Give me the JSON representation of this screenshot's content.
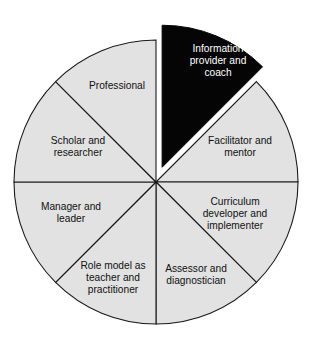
{
  "chart_data": {
    "type": "pie",
    "title": "",
    "subtitle": "",
    "xlabel": "",
    "ylabel": "",
    "legend_position": "none",
    "grid": false,
    "total_slices": 8,
    "slice_angle_degrees": 45,
    "start_angle_degrees": 0,
    "equal_slices": true,
    "categories": [
      "Information provider and coach",
      "Facilitator and mentor",
      "Curriculum developer and implementer",
      "Assessor and diagnostician",
      "Role model as teacher and practitioner",
      "Manager and leader",
      "Scholar and researcher",
      "Professional"
    ],
    "values": [
      12.5,
      12.5,
      12.5,
      12.5,
      12.5,
      12.5,
      12.5,
      12.5
    ],
    "colors": [
      "#050505",
      "#e2e2e2",
      "#e2e2e2",
      "#e2e2e2",
      "#e2e2e2",
      "#e2e2e2",
      "#e2e2e2",
      "#e2e2e2"
    ],
    "exploded": [
      true,
      false,
      false,
      false,
      false,
      false,
      false,
      false
    ],
    "annotations": []
  },
  "geometry": {
    "center_x": 156,
    "center_y": 182,
    "radius": 142,
    "explode_offset": 16,
    "stroke_color": "#1a1a1a",
    "background": "#ffffff"
  },
  "slices": [
    {
      "id": "information-provider-and-coach",
      "lines": [
        "Information",
        "provider and",
        "coach"
      ],
      "color": "#050505",
      "text_color": "#ffffff",
      "exploded": true,
      "start_deg": 0,
      "end_deg": 45,
      "label_x": 218,
      "label_y": 61
    },
    {
      "id": "facilitator-and-mentor",
      "lines": [
        "Facilitator and",
        "mentor"
      ],
      "color": "#e2e2e2",
      "text_color": "#111111",
      "exploded": false,
      "start_deg": 45,
      "end_deg": 90,
      "label_x": 240,
      "label_y": 147
    },
    {
      "id": "curriculum-developer-and-implementer",
      "lines": [
        "Curriculum",
        "developer and",
        "implementer"
      ],
      "color": "#e2e2e2",
      "text_color": "#111111",
      "exploded": false,
      "start_deg": 90,
      "end_deg": 135,
      "label_x": 235,
      "label_y": 214
    },
    {
      "id": "assessor-and-diagnostician",
      "lines": [
        "Assessor and",
        "diagnostician"
      ],
      "color": "#e2e2e2",
      "text_color": "#111111",
      "exploded": false,
      "start_deg": 135,
      "end_deg": 180,
      "label_x": 196,
      "label_y": 275
    },
    {
      "id": "role-model-as-teacher-and-practitioner",
      "lines": [
        "Role model as",
        "teacher and",
        "practitioner"
      ],
      "color": "#e2e2e2",
      "text_color": "#111111",
      "exploded": false,
      "start_deg": 180,
      "end_deg": 225,
      "label_x": 113,
      "label_y": 278
    },
    {
      "id": "manager-and-leader",
      "lines": [
        "Manager and",
        "leader"
      ],
      "color": "#e2e2e2",
      "text_color": "#111111",
      "exploded": false,
      "start_deg": 225,
      "end_deg": 270,
      "label_x": 71,
      "label_y": 213
    },
    {
      "id": "scholar-and-researcher",
      "lines": [
        "Scholar and",
        "researcher"
      ],
      "color": "#e2e2e2",
      "text_color": "#111111",
      "exploded": false,
      "start_deg": 270,
      "end_deg": 315,
      "label_x": 78,
      "label_y": 147
    },
    {
      "id": "professional",
      "lines": [
        "Professional"
      ],
      "color": "#e2e2e2",
      "text_color": "#111111",
      "exploded": false,
      "start_deg": 315,
      "end_deg": 360,
      "label_x": 117,
      "label_y": 86
    }
  ]
}
